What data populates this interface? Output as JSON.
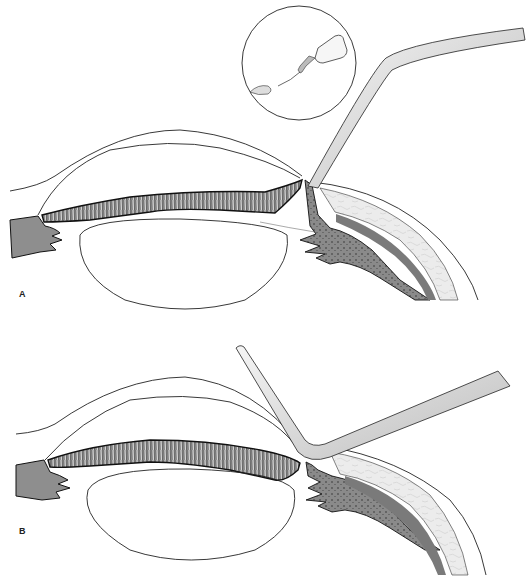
{
  "figure": {
    "colors": {
      "background": "#ffffff",
      "line": "#222222",
      "iris_fill": "#9a9a9a",
      "iris_dark": "#3a3a3a",
      "sclera_fill": "#e6e6e6",
      "uvea_fill": "#8c8c8c",
      "cannula_fill": "#d9d9d9"
    },
    "panels": [
      {
        "id": "A",
        "label": "A",
        "inset": "dropper-bottle-with-cannula"
      },
      {
        "id": "B",
        "label": "B",
        "inset": ""
      }
    ]
  }
}
